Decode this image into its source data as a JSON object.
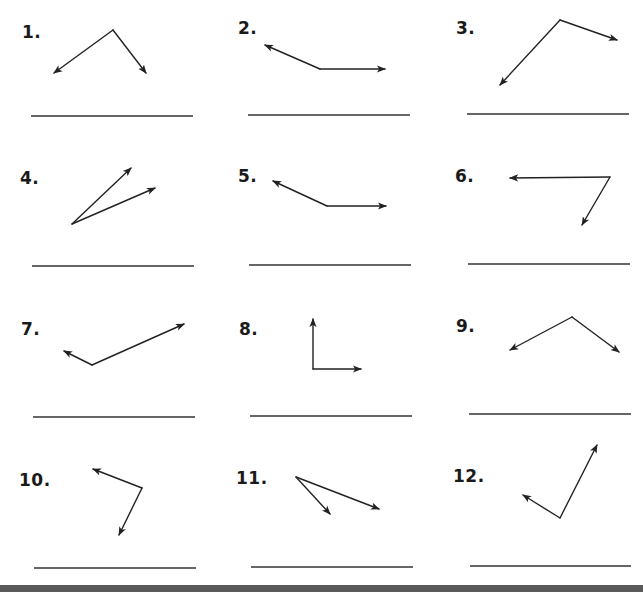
{
  "worksheet": {
    "problems": [
      {
        "number": "1.",
        "label_pos": [
          22,
          24
        ],
        "vertex": [
          113,
          30
        ],
        "rays": [
          [
            54,
            73
          ],
          [
            146,
            73
          ]
        ],
        "answer_line": {
          "x1": 31,
          "x2": 193,
          "y": 116
        }
      },
      {
        "number": "2.",
        "label_pos": [
          238,
          20
        ],
        "vertex": [
          320,
          69
        ],
        "rays": [
          [
            265,
            45
          ],
          [
            385,
            69
          ]
        ],
        "answer_line": {
          "x1": 248,
          "x2": 410,
          "y": 115
        }
      },
      {
        "number": "3.",
        "label_pos": [
          456,
          20
        ],
        "vertex": [
          560,
          20
        ],
        "rays": [
          [
            500,
            85
          ],
          [
            617,
            40
          ]
        ],
        "answer_line": {
          "x1": 467,
          "x2": 629,
          "y": 114
        }
      },
      {
        "number": "4.",
        "label_pos": [
          20,
          170
        ],
        "vertex": [
          72,
          224
        ],
        "rays": [
          [
            131,
            168
          ],
          [
            155,
            188
          ]
        ],
        "answer_line": {
          "x1": 32,
          "x2": 194,
          "y": 266
        }
      },
      {
        "number": "5.",
        "label_pos": [
          238,
          168
        ],
        "vertex": [
          327,
          206
        ],
        "rays": [
          [
            273,
            181
          ],
          [
            386,
            206
          ]
        ],
        "answer_line": {
          "x1": 249,
          "x2": 411,
          "y": 265
        }
      },
      {
        "number": "6.",
        "label_pos": [
          455,
          168
        ],
        "vertex": [
          610,
          177
        ],
        "rays": [
          [
            510,
            178
          ],
          [
            582,
            225
          ]
        ],
        "answer_line": {
          "x1": 468,
          "x2": 630,
          "y": 264
        }
      },
      {
        "number": "7.",
        "label_pos": [
          21,
          321
        ],
        "vertex": [
          92,
          365
        ],
        "rays": [
          [
            64,
            351
          ],
          [
            184,
            324
          ]
        ],
        "answer_line": {
          "x1": 33,
          "x2": 195,
          "y": 417
        }
      },
      {
        "number": "8.",
        "label_pos": [
          239,
          321
        ],
        "vertex": [
          313,
          369
        ],
        "rays": [
          [
            313,
            319
          ],
          [
            361,
            369
          ]
        ],
        "answer_line": {
          "x1": 250,
          "x2": 412,
          "y": 416
        }
      },
      {
        "number": "9.",
        "label_pos": [
          456,
          318
        ],
        "vertex": [
          572,
          317
        ],
        "rays": [
          [
            510,
            350
          ],
          [
            619,
            352
          ]
        ],
        "answer_line": {
          "x1": 469,
          "x2": 631,
          "y": 414
        }
      },
      {
        "number": "10.",
        "label_pos": [
          19,
          472
        ],
        "vertex": [
          142,
          488
        ],
        "rays": [
          [
            93,
            469
          ],
          [
            119,
            535
          ]
        ],
        "answer_line": {
          "x1": 34,
          "x2": 196,
          "y": 568
        }
      },
      {
        "number": "11.",
        "label_pos": [
          236,
          470
        ],
        "vertex": [
          296,
          477
        ],
        "rays": [
          [
            330,
            514
          ],
          [
            379,
            509
          ]
        ],
        "answer_line": {
          "x1": 251,
          "x2": 413,
          "y": 567
        }
      },
      {
        "number": "12.",
        "label_pos": [
          453,
          468
        ],
        "vertex": [
          560,
          518
        ],
        "rays": [
          [
            523,
            495
          ],
          [
            597,
            445
          ]
        ],
        "answer_line": {
          "x1": 470,
          "x2": 631,
          "y": 566
        }
      }
    ],
    "colors": {
      "ink": "#222222",
      "answer_line": "#333333",
      "bottom_bar": "#5a5a5a",
      "background": "#ffffff"
    }
  }
}
